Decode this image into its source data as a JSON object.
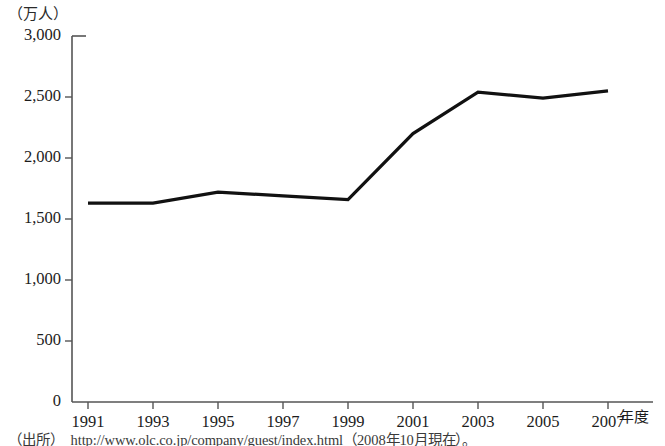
{
  "chart_data": {
    "type": "line",
    "title": "",
    "subtitle": "",
    "xlabel": "年度",
    "ylabel": "（万人）",
    "unit_label": "（万人）",
    "x_axis_unit": "年度",
    "categories": [
      "1991",
      "1993",
      "1995",
      "1997",
      "1999",
      "2001",
      "2003",
      "2005",
      "2007"
    ],
    "x": [
      1991,
      1993,
      1995,
      1997,
      1999,
      2001,
      2003,
      2005,
      2007
    ],
    "values": [
      1630,
      1630,
      1720,
      1690,
      1660,
      2200,
      2540,
      2490,
      2550
    ],
    "series": [
      {
        "name": "入園者数",
        "values": [
          1630,
          1630,
          1720,
          1690,
          1660,
          2200,
          2540,
          2490,
          2550
        ]
      }
    ],
    "ylim": [
      0,
      3000
    ],
    "ytick_values": [
      0,
      500,
      1000,
      1500,
      2000,
      2500,
      3000
    ],
    "ytick_labels": [
      "0",
      "500",
      "1,000",
      "1,500",
      "2,000",
      "2,500",
      "3,000"
    ],
    "xtick_labels": [
      "1991",
      "1993",
      "1995",
      "1997",
      "1999",
      "2001",
      "2003",
      "2005",
      "2007"
    ],
    "grid": false,
    "legend": false,
    "legend_position": "none",
    "line_color": "#111111",
    "line_width": 3.2,
    "axis_color": "#555555",
    "background_color": "#ffffff"
  },
  "source": {
    "tag": "（出所）",
    "text": "http://www.olc.co.jp/company/guest/index.html（2008年10月現在）。"
  }
}
